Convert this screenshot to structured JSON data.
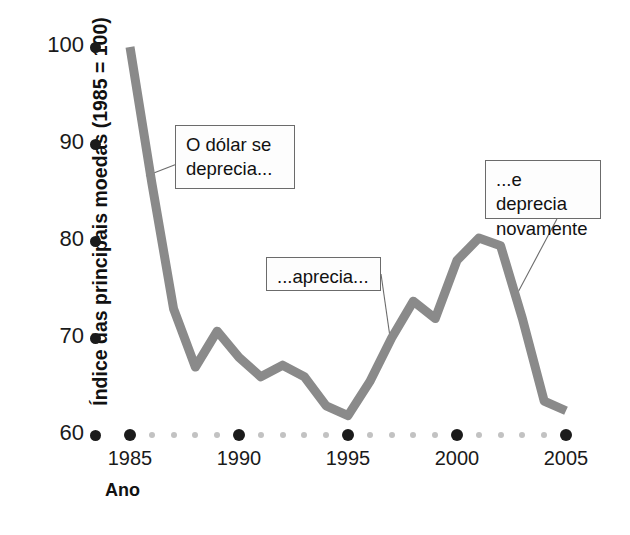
{
  "chart_data": {
    "type": "line",
    "title": "",
    "xlabel": "Ano",
    "ylabel": "Índice das principais moedas (1985 = 100)",
    "xlim": [
      1984.6,
      2005.6
    ],
    "ylim": [
      60,
      100
    ],
    "xticks": [
      1985,
      1990,
      1995,
      2000,
      2005
    ],
    "xticklabels": [
      "1985",
      "1990",
      "1995",
      "2000",
      "2005"
    ],
    "yticks": [
      60,
      70,
      80,
      90,
      100
    ],
    "yticklabels": [
      "60",
      "70",
      "80",
      "90",
      "100"
    ],
    "grid": false,
    "legend": null,
    "series": [
      {
        "name": "Índice das principais moedas",
        "color": "#8a8a8a",
        "x": [
          1985.0,
          1986.0,
          1987.0,
          1988.0,
          1989.0,
          1990.0,
          1991.0,
          1992.0,
          1993.0,
          1994.0,
          1995.0,
          1996.0,
          1997.0,
          1998.0,
          1999.0,
          2000.0,
          2001.0,
          2002.0,
          2003.0,
          2004.0,
          2005.0
        ],
        "y": [
          100.0,
          86.0,
          73.0,
          67.0,
          70.7,
          68.0,
          66.0,
          67.2,
          66.0,
          63.0,
          62.0,
          65.5,
          70.0,
          73.8,
          72.0,
          78.0,
          80.3,
          79.5,
          72.0,
          63.5,
          62.5
        ]
      }
    ],
    "annotations": [
      {
        "name": "o-dolar-se-deprecia",
        "text": "O dólar se\ndeprecia...",
        "box": {
          "x": 175,
          "y": 125,
          "width": 120,
          "height": 64
        },
        "leader_to": {
          "x": 146,
          "y": 176
        }
      },
      {
        "name": "aprecia",
        "text": "...aprecia...",
        "box": {
          "x": 266,
          "y": 257,
          "width": 115,
          "height": 34
        },
        "leader_to": {
          "x": 390,
          "y": 337
        }
      },
      {
        "name": "e-deprecia-novamente",
        "text": "...e deprecia\nnovamente",
        "box": {
          "x": 485,
          "y": 160,
          "width": 116,
          "height": 59
        },
        "leader_to": {
          "x": 516,
          "y": 296
        }
      }
    ],
    "axis_dots": {
      "major_years": [
        1985,
        1990,
        1995,
        2000,
        2005
      ],
      "minor_years": [
        1986,
        1987,
        1988,
        1989,
        1991,
        1992,
        1993,
        1994,
        1996,
        1997,
        1998,
        1999,
        2001,
        2002,
        2003,
        2004
      ],
      "major_color": "#1b1b1b",
      "minor_color": "#c2c2c2"
    },
    "colors": {
      "line": "#8a8a8a",
      "text": "#1a1a1a",
      "callout_border": "#6b6b6b",
      "callout_fill": "#fdfdfd",
      "background": "#ffffff"
    }
  }
}
